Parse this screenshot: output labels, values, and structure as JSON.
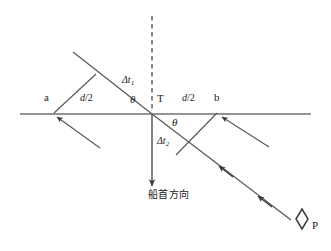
{
  "figure": {
    "kind": "geometry-diagram",
    "width": 331,
    "height": 251,
    "background": "#ffffff",
    "line_color": "#4d4d4d",
    "text_color": "#1a1a1a"
  },
  "labels": {
    "point_a": "a",
    "point_b": "b",
    "point_t": "T",
    "point_p": "P",
    "half_spacing_left_d": "d",
    "half_spacing_left_slash2": "/2",
    "half_spacing_right_d": "d",
    "half_spacing_right_slash2": "/2",
    "theta_left": "θ",
    "theta_right": "θ",
    "delta_t1_head": "Δt",
    "delta_t1_sub": "1",
    "delta_t2_head": "Δt",
    "delta_t2_sub": "2",
    "heading_text": "船首方向"
  },
  "elements": {
    "baseline_name": "horizontal-baseline",
    "dashed_reference_name": "dashed-vertical-reference",
    "heading_arrow_name": "ship-heading-arrow",
    "ray_upper_left_name": "incoming-ray-to-a",
    "ray_lower_right_name": "incoming-ray-to-b",
    "perpendicular_left_name": "perpendicular-foot-left",
    "perpendicular_right_name": "perpendicular-foot-right",
    "target_marker_name": "target-vessel-diamond"
  },
  "geometry": {
    "baseline": {
      "x1": 20,
      "y1": 114,
      "x2": 311,
      "y2": 114
    },
    "t_point": {
      "x": 152,
      "y": 114
    },
    "a_point": {
      "x": 53,
      "y": 114
    },
    "b_point": {
      "x": 218,
      "y": 114
    },
    "dashed_line": {
      "x1": 152,
      "y1": 16,
      "x2": 152,
      "y2": 112
    },
    "heading_arrow": {
      "x1": 152,
      "y1": 115,
      "x2": 152,
      "y2": 189
    },
    "main_diagonal": {
      "x1": 73,
      "y1": 52,
      "x2": 294,
      "y2": 222
    },
    "perp_left": {
      "x1": 53,
      "y1": 114,
      "x2": 96,
      "y2": 74
    },
    "perp_right": {
      "x1": 218,
      "y1": 114,
      "x2": 176,
      "y2": 155
    },
    "ray_into_a": {
      "x1": 98,
      "y1": 146,
      "x2": 53,
      "y2": 114
    },
    "ray_into_b": {
      "x1": 268,
      "y1": 146,
      "x2": 218,
      "y2": 114
    },
    "diamond": {
      "cx": 302,
      "cy": 219,
      "rx": 6,
      "ry": 10
    }
  },
  "label_positions": {
    "a": {
      "x": 44,
      "y": 98
    },
    "b": {
      "x": 214,
      "y": 98
    },
    "t": {
      "x": 157,
      "y": 99
    },
    "p": {
      "x": 311,
      "y": 224
    },
    "d2_left": {
      "x": 83,
      "y": 99
    },
    "d2_right": {
      "x": 185,
      "y": 99
    },
    "theta_left": {
      "x": 131,
      "y": 100
    },
    "theta_right": {
      "x": 172,
      "y": 122
    },
    "delta_t1": {
      "x": 125,
      "y": 79
    },
    "delta_t2": {
      "x": 160,
      "y": 140
    },
    "heading": {
      "x": 150,
      "y": 190
    }
  }
}
